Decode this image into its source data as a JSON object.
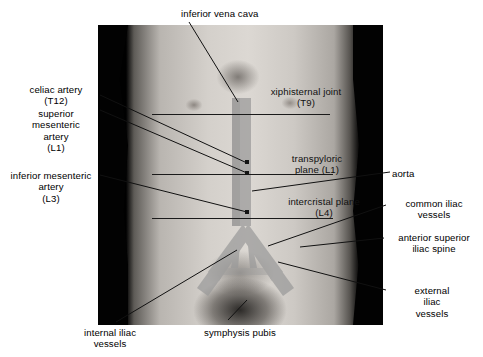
{
  "colors": {
    "vessel_overlay": "#9a9a9a",
    "vessel_overlay_dark": "#848484",
    "leader_line": "#111111",
    "plane_line": "#1a1a1a",
    "background": "#ffffff",
    "photo_border": "#000000",
    "label_text": "#000000"
  },
  "labels": {
    "top": [
      {
        "id": "inferior-vena-cava",
        "text": "inferior vena cava",
        "x": 181,
        "y": 8,
        "align": "left",
        "on_photo": false
      }
    ],
    "left": [
      {
        "id": "celiac-artery",
        "text": "celiac artery\n(T12)",
        "x": 12,
        "y": 84,
        "width": 88,
        "align": "center",
        "on_photo": false
      },
      {
        "id": "superior-mesenteric-artery",
        "text": "superior\nmesenteric\nartery\n(L1)",
        "x": 12,
        "y": 108,
        "width": 88,
        "align": "center",
        "on_photo": false
      },
      {
        "id": "inferior-mesenteric-artery",
        "text": "inferior mesenteric\nartery\n(L3)",
        "x": 2,
        "y": 170,
        "width": 98,
        "align": "center",
        "on_photo": false
      }
    ],
    "right": [
      {
        "id": "aorta",
        "text": "aorta",
        "x": 392,
        "y": 168,
        "width": 88,
        "align": "left",
        "on_photo": false
      },
      {
        "id": "common-iliac-vessels",
        "text": "common iliac\nvessels",
        "x": 388,
        "y": 198,
        "width": 92,
        "align": "center",
        "on_photo": false
      },
      {
        "id": "anterior-superior-iliac-spine",
        "text": "anterior superior\niliac spine",
        "x": 386,
        "y": 232,
        "width": 96,
        "align": "center",
        "on_photo": false
      },
      {
        "id": "external-iliac-vessels",
        "text": "external\niliac\nvessels",
        "x": 388,
        "y": 285,
        "width": 88,
        "align": "center",
        "on_photo": false
      }
    ],
    "on_photo": [
      {
        "id": "xiphisternal-joint",
        "text": "xiphisternal joint\n(T9)",
        "x": 256,
        "y": 86,
        "width": 100,
        "align": "center",
        "on_photo": true
      },
      {
        "id": "transpyloric-plane",
        "text": "transpyloric\nplane (L1)",
        "x": 275,
        "y": 153,
        "width": 84,
        "align": "center",
        "on_photo": true
      },
      {
        "id": "intercristal-plane",
        "text": "intercristal plane\n(L4)",
        "x": 274,
        "y": 196,
        "width": 100,
        "align": "center",
        "on_photo": true
      }
    ],
    "bottom": [
      {
        "id": "internal-iliac-vessels",
        "text": "internal iliac\nvessels",
        "x": 64,
        "y": 327,
        "width": 92,
        "align": "center",
        "on_photo": false
      },
      {
        "id": "symphysis-pubis",
        "text": "symphysis pubis",
        "x": 185,
        "y": 327,
        "width": 110,
        "align": "center",
        "on_photo": false
      }
    ]
  },
  "anatomical_structures": [
    {
      "name": "aorta",
      "vertebral_level": "",
      "type": "artery"
    },
    {
      "name": "inferior vena cava",
      "vertebral_level": "",
      "type": "vein"
    },
    {
      "name": "celiac artery",
      "vertebral_level": "T12",
      "type": "artery"
    },
    {
      "name": "superior mesenteric artery",
      "vertebral_level": "L1",
      "type": "artery"
    },
    {
      "name": "inferior mesenteric artery",
      "vertebral_level": "L3",
      "type": "artery"
    },
    {
      "name": "common iliac vessels",
      "vertebral_level": "",
      "type": "vessel"
    },
    {
      "name": "internal iliac vessels",
      "vertebral_level": "",
      "type": "vessel"
    },
    {
      "name": "external iliac vessels",
      "vertebral_level": "",
      "type": "vessel"
    },
    {
      "name": "xiphisternal joint",
      "vertebral_level": "T9",
      "type": "landmark"
    },
    {
      "name": "transpyloric plane",
      "vertebral_level": "L1",
      "type": "plane"
    },
    {
      "name": "intercristal plane",
      "vertebral_level": "L4",
      "type": "plane"
    },
    {
      "name": "anterior superior iliac spine",
      "vertebral_level": "",
      "type": "landmark"
    },
    {
      "name": "symphysis pubis",
      "vertebral_level": "",
      "type": "landmark"
    }
  ]
}
